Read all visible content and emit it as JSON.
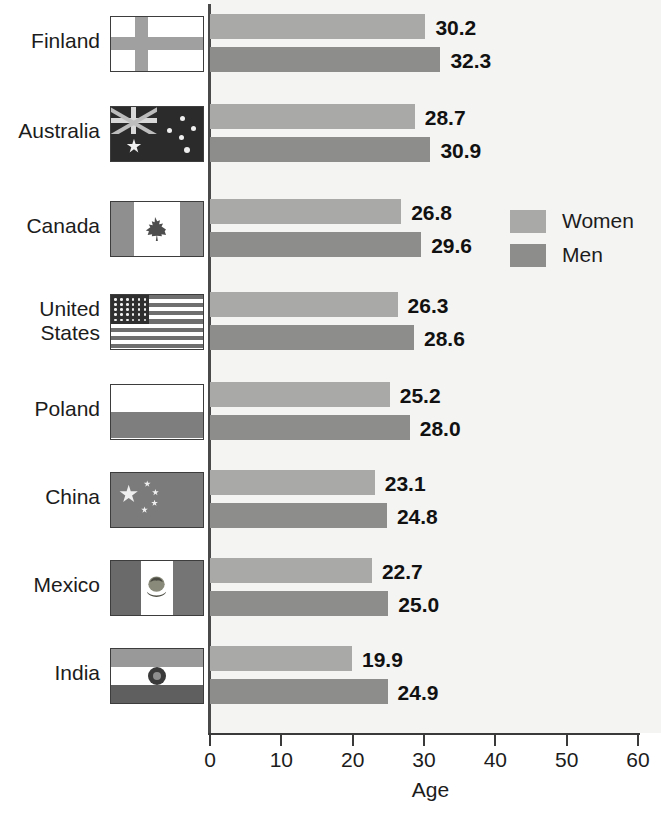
{
  "chart_data": {
    "type": "bar",
    "orientation": "horizontal",
    "title": "",
    "xlabel": "Age",
    "ylabel": "",
    "xlim": [
      0,
      60
    ],
    "xticks": [
      0,
      10,
      20,
      30,
      40,
      50,
      60
    ],
    "grid": false,
    "legend_position": "inside-right-upper",
    "categories": [
      "Finland",
      "Australia",
      "Canada",
      "United States",
      "Poland",
      "China",
      "Mexico",
      "India"
    ],
    "series": [
      {
        "name": "Women",
        "color": "#a9a9a7",
        "values": [
          30.2,
          28.7,
          26.8,
          26.3,
          25.2,
          23.1,
          22.7,
          19.9
        ]
      },
      {
        "name": "Men",
        "color": "#8d8d8b",
        "values": [
          32.3,
          30.9,
          29.6,
          28.6,
          28.0,
          24.8,
          25.0,
          24.9
        ]
      }
    ]
  },
  "axis": {
    "x_title": "Age",
    "tick_labels": [
      "0",
      "10",
      "20",
      "30",
      "40",
      "50",
      "60"
    ]
  },
  "legend": {
    "items": [
      {
        "label": "Women"
      },
      {
        "label": "Men"
      }
    ]
  },
  "rows": [
    {
      "country": "Finland",
      "country_line1": "Finland",
      "country_line2": "",
      "flag": "flag-finland",
      "women": "30.2",
      "men": "32.3"
    },
    {
      "country": "Australia",
      "country_line1": "Australia",
      "country_line2": "",
      "flag": "flag-australia",
      "women": "28.7",
      "men": "30.9"
    },
    {
      "country": "Canada",
      "country_line1": "Canada",
      "country_line2": "",
      "flag": "flag-canada",
      "women": "26.8",
      "men": "29.6"
    },
    {
      "country": "United States",
      "country_line1": "United",
      "country_line2": "States",
      "flag": "flag-united-states",
      "women": "26.3",
      "men": "28.6"
    },
    {
      "country": "Poland",
      "country_line1": "Poland",
      "country_line2": "",
      "flag": "flag-poland",
      "women": "25.2",
      "men": "28.0"
    },
    {
      "country": "China",
      "country_line1": "China",
      "country_line2": "",
      "flag": "flag-china",
      "women": "23.1",
      "men": "24.8"
    },
    {
      "country": "Mexico",
      "country_line1": "Mexico",
      "country_line2": "",
      "flag": "flag-mexico",
      "women": "22.7",
      "men": "25.0"
    },
    {
      "country": "India",
      "country_line1": "India",
      "country_line2": "",
      "flag": "flag-india",
      "women": "19.9",
      "men": "24.9"
    }
  ],
  "colors": {
    "women": "#a9a9a7",
    "men": "#8d8d8b",
    "plot_bg": "#f4f4f3",
    "axis": "#3a3a3a",
    "text": "#1c1c1c"
  }
}
